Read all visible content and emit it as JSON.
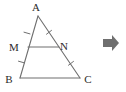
{
  "figure": {
    "type": "geometry-diagram",
    "background_color": "#ffffff",
    "stroke_color": "#6f6f6f",
    "label_color": "#2b2b2b",
    "canvas": {
      "width": 126,
      "height": 92
    }
  },
  "points": {
    "A": {
      "label": "A",
      "x": 38,
      "y": 16,
      "label_x": 36,
      "label_y": 11
    },
    "B": {
      "label": "B",
      "x": 20,
      "y": 78,
      "label_x": 9,
      "label_y": 83
    },
    "C": {
      "label": "C",
      "x": 80,
      "y": 78,
      "label_x": 85,
      "label_y": 83
    },
    "M": {
      "label": "M",
      "x": 28,
      "y": 47,
      "label_x": 11,
      "label_y": 51
    },
    "N": {
      "label": "N",
      "x": 59,
      "y": 47,
      "label_x": 62,
      "label_y": 50
    }
  },
  "segments": [
    {
      "name": "AB",
      "from": "A",
      "to": "B"
    },
    {
      "name": "AC",
      "from": "A",
      "to": "C"
    },
    {
      "name": "BC",
      "from": "B",
      "to": "C"
    },
    {
      "name": "MN",
      "from": "M",
      "to": "N"
    }
  ],
  "tick_marks": [
    {
      "name": "tick-AM",
      "segment": "AM",
      "x": 27,
      "y": 35,
      "angle": -74,
      "count": 1
    },
    {
      "name": "tick-MB",
      "segment": "MB",
      "x": 21,
      "y": 63,
      "angle": -74,
      "count": 1
    },
    {
      "name": "tick-AN",
      "segment": "AN",
      "x": 50,
      "y": 33,
      "angle": 56,
      "count": 1
    },
    {
      "name": "tick-NC",
      "segment": "NC",
      "x": 71,
      "y": 64,
      "angle": 56,
      "count": 1
    }
  ],
  "arrow": {
    "name": "right-arrow",
    "glyph": "➜",
    "x": 103,
    "y": 35,
    "width": 18,
    "height": 16,
    "color": "#6f6f6f"
  }
}
